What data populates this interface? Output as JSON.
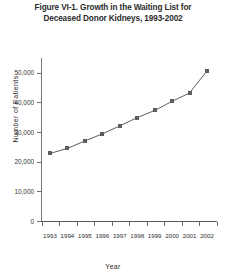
{
  "figure": {
    "title_lines": [
      "Figure VI-1. Growth in the Waiting List for",
      "Deceased Donor Kidneys, 1993-2002"
    ],
    "title_full": "Figure VI-1. Growth in the Waiting List for Deceased Donor Kidneys, 1993-2002"
  },
  "colors": {
    "series": "#5e5e5e",
    "axis": "#6d6d6d",
    "text": "#2b2b2b",
    "background": "#ffffff"
  },
  "chart_data": {
    "type": "line",
    "title": "Figure VI-1. Growth in the Waiting List for Deceased Donor Kidneys, 1993-2002",
    "xlabel": "Year",
    "ylabel": "Number of Patients",
    "categories": [
      "1993",
      "1994",
      "1995",
      "1996",
      "1997",
      "1998",
      "1999",
      "2000",
      "2001",
      "2002"
    ],
    "values": [
      22800,
      24500,
      27000,
      29400,
      32100,
      34900,
      37300,
      40400,
      43200,
      50700
    ],
    "ylim": [
      0,
      55000
    ],
    "yticks": [
      0,
      10000,
      20000,
      30000,
      40000,
      50000
    ],
    "ytick_labels": [
      "0",
      "10,000",
      "20,000",
      "30,000",
      "40,000",
      "50,000"
    ],
    "xtick_labels": [
      "1993",
      "1994",
      "1995",
      "1996",
      "1997",
      "1998",
      "1999",
      "2000",
      "2001",
      "2002"
    ],
    "grid": false,
    "legend": false,
    "marker": "square",
    "series_color": "#5e5e5e"
  }
}
